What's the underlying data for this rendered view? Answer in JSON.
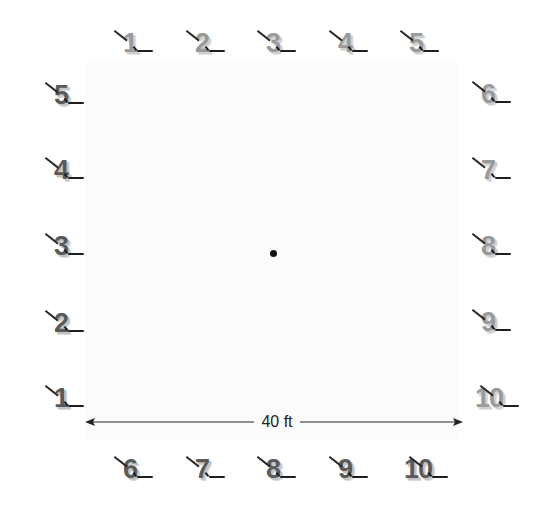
{
  "diagram": {
    "dimension_label": "40 ft",
    "colors": {
      "dark_digit": "#5a5a5a",
      "light_digit": "#9a9a9a",
      "mark": "#1e1e1e",
      "field": "#fbfbfb"
    },
    "top_row": [
      {
        "label": "1"
      },
      {
        "label": "2"
      },
      {
        "label": "3"
      },
      {
        "label": "4"
      },
      {
        "label": "5"
      }
    ],
    "right_column": [
      {
        "label": "6"
      },
      {
        "label": "7"
      },
      {
        "label": "8"
      },
      {
        "label": "9"
      },
      {
        "label": "10"
      }
    ],
    "left_column": [
      {
        "label": "5"
      },
      {
        "label": "4"
      },
      {
        "label": "3"
      },
      {
        "label": "2"
      },
      {
        "label": "1"
      }
    ],
    "bottom_row": [
      {
        "label": "6"
      },
      {
        "label": "7"
      },
      {
        "label": "8"
      },
      {
        "label": "9"
      },
      {
        "label": "10"
      }
    ],
    "center_marker": "center-dot"
  }
}
